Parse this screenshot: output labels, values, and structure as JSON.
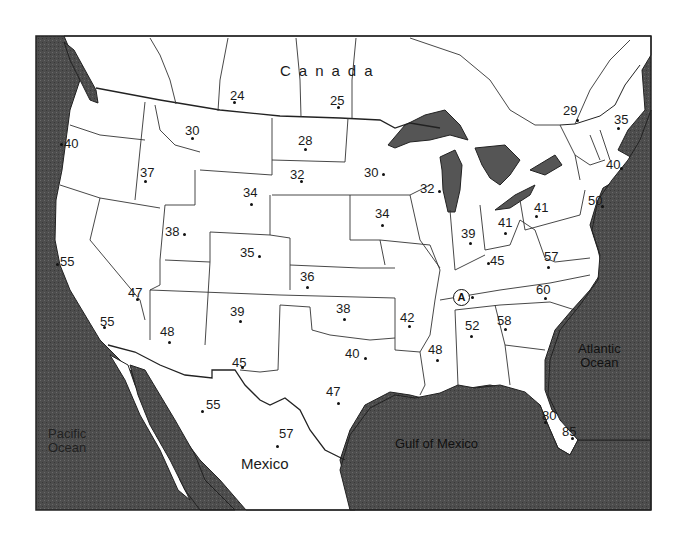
{
  "map": {
    "title": "",
    "region_labels": {
      "canada": "Canada",
      "mexico": "Mexico"
    },
    "water_labels": {
      "pacific": [
        "Pacific",
        "Ocean"
      ],
      "atlantic": [
        "Atlantic",
        "Ocean"
      ],
      "gulf": "Gulf of Mexico"
    },
    "marker": {
      "label": "A",
      "location": "Tennessee"
    },
    "colors": {
      "water": "#4a4a4a",
      "land": "#ffffff",
      "border": "#222222"
    },
    "values": [
      {
        "id": "canada-1",
        "value": "24",
        "x": 230,
        "y": 89,
        "dx": 3,
        "dy": 12
      },
      {
        "id": "canada-2",
        "value": "25",
        "x": 330,
        "y": 94,
        "dx": 7,
        "dy": 12
      },
      {
        "id": "quebec",
        "value": "29",
        "x": 563,
        "y": 104,
        "dx": 13,
        "dy": 15
      },
      {
        "id": "maine",
        "value": "35",
        "x": 614,
        "y": 113,
        "dx": 3,
        "dy": 14
      },
      {
        "id": "oregon",
        "value": "40",
        "x": 64,
        "y": 137,
        "dx": -4,
        "dy": 6
      },
      {
        "id": "montana",
        "value": "30",
        "x": 185,
        "y": 124,
        "dx": 6,
        "dy": 13
      },
      {
        "id": "north-dakota",
        "value": "28",
        "x": 298,
        "y": 134,
        "dx": 6,
        "dy": 14
      },
      {
        "id": "idaho",
        "value": "37",
        "x": 140,
        "y": 166,
        "dx": 4,
        "dy": 14
      },
      {
        "id": "south-dakota",
        "value": "32",
        "x": 290,
        "y": 168,
        "dx": 10,
        "dy": 12
      },
      {
        "id": "minnesota",
        "value": "30",
        "x": 364,
        "y": 166,
        "dx": 18,
        "dy": 7
      },
      {
        "id": "wisconsin",
        "value": "32",
        "x": 420,
        "y": 182,
        "dx": 18,
        "dy": 8
      },
      {
        "id": "massachusetts",
        "value": "40",
        "x": 606,
        "y": 158,
        "dx": 14,
        "dy": 9
      },
      {
        "id": "wyoming",
        "value": "34",
        "x": 243,
        "y": 186,
        "dx": 7,
        "dy": 17
      },
      {
        "id": "iowa",
        "value": "34",
        "x": 375,
        "y": 207,
        "dx": 6,
        "dy": 17
      },
      {
        "id": "new-jersey",
        "value": "50",
        "x": 588,
        "y": 194,
        "dx": 13,
        "dy": 11
      },
      {
        "id": "pennsylvania",
        "value": "41",
        "x": 534,
        "y": 201,
        "dx": 1,
        "dy": 14
      },
      {
        "id": "ohio",
        "value": "41",
        "x": 498,
        "y": 216,
        "dx": 6,
        "dy": 16
      },
      {
        "id": "indiana",
        "value": "39",
        "x": 461,
        "y": 227,
        "dx": 8,
        "dy": 15
      },
      {
        "id": "utah",
        "value": "38",
        "x": 165,
        "y": 225,
        "dx": 18,
        "dy": 8
      },
      {
        "id": "colorado",
        "value": "35",
        "x": 240,
        "y": 246,
        "dx": 18,
        "dy": 9
      },
      {
        "id": "kentucky",
        "value": "45",
        "x": 490,
        "y": 254,
        "dx": -3,
        "dy": 8
      },
      {
        "id": "virginia",
        "value": "57",
        "x": 544,
        "y": 250,
        "dx": 3,
        "dy": 16
      },
      {
        "id": "california",
        "value": "55",
        "x": 60,
        "y": 255,
        "dx": -4,
        "dy": 8
      },
      {
        "id": "kansas",
        "value": "36",
        "x": 300,
        "y": 270,
        "dx": 6,
        "dy": 16
      },
      {
        "id": "nevada-south",
        "value": "47",
        "x": 128,
        "y": 286,
        "dx": 8,
        "dy": 12
      },
      {
        "id": "north-carolina",
        "value": "60",
        "x": 536,
        "y": 283,
        "dx": 8,
        "dy": 14
      },
      {
        "id": "socal",
        "value": "55",
        "x": 100,
        "y": 315,
        "dx": 3,
        "dy": 11
      },
      {
        "id": "new-mexico",
        "value": "39",
        "x": 230,
        "y": 305,
        "dx": 9,
        "dy": 15
      },
      {
        "id": "oklahoma",
        "value": "38",
        "x": 336,
        "y": 302,
        "dx": 7,
        "dy": 16
      },
      {
        "id": "arkansas",
        "value": "42",
        "x": 400,
        "y": 311,
        "dx": 8,
        "dy": 14
      },
      {
        "id": "georgia",
        "value": "58",
        "x": 497,
        "y": 314,
        "dx": 7,
        "dy": 14
      },
      {
        "id": "alabama",
        "value": "52",
        "x": 465,
        "y": 319,
        "dx": 5,
        "dy": 16
      },
      {
        "id": "arizona",
        "value": "48",
        "x": 160,
        "y": 325,
        "dx": 8,
        "dy": 16
      },
      {
        "id": "texas-north",
        "value": "40",
        "x": 345,
        "y": 347,
        "dx": 19,
        "dy": 10
      },
      {
        "id": "mississippi",
        "value": "48",
        "x": 428,
        "y": 343,
        "dx": 8,
        "dy": 16
      },
      {
        "id": "el-paso",
        "value": "45",
        "x": 232,
        "y": 356,
        "dx": 9,
        "dy": 10
      },
      {
        "id": "texas-central",
        "value": "47",
        "x": 326,
        "y": 385,
        "dx": 11,
        "dy": 17
      },
      {
        "id": "florida-west",
        "value": "80",
        "x": 542,
        "y": 409,
        "dx": 2,
        "dy": 12
      },
      {
        "id": "mexico-north",
        "value": "55",
        "x": 206,
        "y": 398,
        "dx": -5,
        "dy": 12
      },
      {
        "id": "florida-east",
        "value": "85",
        "x": 562,
        "y": 425,
        "dx": 9,
        "dy": 12
      },
      {
        "id": "mexico-central",
        "value": "57",
        "x": 279,
        "y": 427,
        "dx": -3,
        "dy": 18
      }
    ]
  }
}
